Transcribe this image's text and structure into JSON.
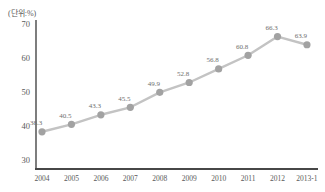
{
  "page": {
    "background": "#ffffff"
  },
  "chart_data": {
    "type": "line",
    "title": "",
    "unit_label": "(단위:%)",
    "categories": [
      "2004",
      "2005",
      "2006",
      "2007",
      "2008",
      "2009",
      "2010",
      "2011",
      "2012",
      "2013-1"
    ],
    "values": [
      38.3,
      40.5,
      43.3,
      45.5,
      49.9,
      52.8,
      56.8,
      60.8,
      66.3,
      63.9
    ],
    "xlabel": "",
    "ylabel": "(단위:%)",
    "yticks": [
      30,
      40,
      50,
      60,
      70
    ],
    "ylim": [
      27,
      71
    ],
    "grid": false,
    "legend": "none",
    "marker": "circle",
    "value_decimals": 1
  },
  "colors": {
    "background": "#ffffff",
    "axis": "#474747",
    "tick_text": "#595959",
    "category_text": "#595959",
    "data_label_text": "#6e6e6e",
    "line": "#c3c3c3",
    "marker": "#a2a2a2"
  }
}
